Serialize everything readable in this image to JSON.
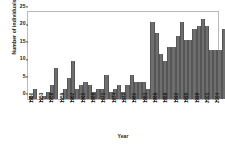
{
  "chart_data": {
    "type": "bar",
    "title": "",
    "xlabel": "Year",
    "ylabel": "Number of individuals",
    "ylim": [
      0,
      25
    ],
    "yticks": [
      0,
      5,
      10,
      15,
      20,
      25
    ],
    "grid": false,
    "legend": false,
    "bar_color": "#6e6e6e",
    "frame_color": "#b9b9b9",
    "xtick_labels": [
      "1950",
      "1953",
      "1956",
      "1959",
      "1962",
      "1965",
      "1968",
      "1971",
      "1974",
      "1977",
      "1980",
      "1983",
      "1986",
      "1989",
      "1992",
      "1995",
      "1998",
      "2001",
      "2004"
    ],
    "xtick_step": 3,
    "categories": [
      "1950",
      "1951",
      "1952",
      "1953",
      "1954",
      "1955",
      "1956",
      "1957",
      "1958",
      "1959",
      "1960",
      "1961",
      "1962",
      "1963",
      "1964",
      "1965",
      "1966",
      "1967",
      "1968",
      "1969",
      "1970",
      "1971",
      "1972",
      "1973",
      "1974",
      "1975",
      "1976",
      "1977",
      "1978",
      "1979",
      "1980",
      "1981",
      "1982",
      "1983",
      "1984",
      "1985",
      "1986",
      "1987",
      "1988",
      "1989",
      "1990",
      "1991",
      "1992",
      "1993",
      "1994",
      "1995",
      "1996",
      "1997",
      "1998",
      "1999",
      "2000",
      "2001",
      "2002",
      "2003",
      "2004"
    ],
    "values": [
      1,
      3,
      0,
      1,
      2,
      4,
      9,
      0,
      3,
      6,
      11,
      3,
      4,
      5,
      4,
      2,
      3,
      3,
      7,
      2,
      3,
      4,
      2,
      4,
      7,
      5,
      5,
      5,
      3,
      22,
      19,
      13,
      11,
      15,
      15,
      18,
      22,
      17,
      17,
      20,
      21,
      23,
      21,
      14,
      14,
      14,
      20,
      14,
      9,
      7,
      12,
      10,
      3,
      7,
      3
    ]
  }
}
